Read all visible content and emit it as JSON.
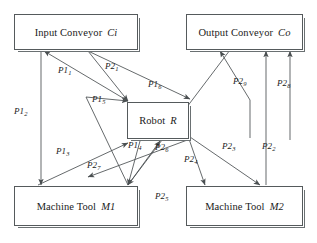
{
  "diagram": {
    "background_color": "#ffffff",
    "line_color": "#4a4f51",
    "box_border_color": "#555a5c",
    "box_shadow_color": "#6a7072",
    "text_color": "#1a1a1a",
    "nodes": [
      {
        "id": "Ci",
        "name": "Input Conveyor",
        "symbol": "Ci",
        "x": 14,
        "y": 14,
        "w": 124,
        "h": 36
      },
      {
        "id": "Co",
        "name": "Output Conveyor",
        "symbol": "Co",
        "x": 186,
        "y": 14,
        "w": 117,
        "h": 36
      },
      {
        "id": "R",
        "name": "Robot",
        "symbol": "R",
        "x": 127,
        "y": 102,
        "w": 62,
        "h": 37
      },
      {
        "id": "M1",
        "name": "Machine Tool",
        "symbol": "M1",
        "x": 14,
        "y": 186,
        "w": 124,
        "h": 40
      },
      {
        "id": "M2",
        "name": "Machine Tool",
        "symbol": "M2",
        "x": 186,
        "y": 186,
        "w": 117,
        "h": 40
      }
    ],
    "edge_labels": [
      {
        "id": "P1_1",
        "base": "P1",
        "sub": "1",
        "x": 58,
        "y": 66
      },
      {
        "id": "P1_2",
        "base": "P1",
        "sub": "2",
        "x": 14,
        "y": 107
      },
      {
        "id": "P1_3",
        "base": "P1",
        "sub": "3",
        "x": 56,
        "y": 147
      },
      {
        "id": "P1_4",
        "base": "P1",
        "sub": "4",
        "x": 128,
        "y": 141
      },
      {
        "id": "P1_5",
        "base": "P1",
        "sub": "5",
        "x": 92,
        "y": 95
      },
      {
        "id": "P1_6",
        "base": "P1",
        "sub": "6",
        "x": 148,
        "y": 80
      },
      {
        "id": "P2_1",
        "base": "P2",
        "sub": "1",
        "x": 105,
        "y": 62
      },
      {
        "id": "P2_2",
        "base": "P2",
        "sub": "2",
        "x": 262,
        "y": 142
      },
      {
        "id": "P2_3",
        "base": "P2",
        "sub": "3",
        "x": 222,
        "y": 142
      },
      {
        "id": "P2_4",
        "base": "P2",
        "sub": "4",
        "x": 184,
        "y": 155
      },
      {
        "id": "P2_5",
        "base": "P2",
        "sub": "5",
        "x": 155,
        "y": 192
      },
      {
        "id": "P2_6",
        "base": "P2",
        "sub": "6",
        "x": 155,
        "y": 143
      },
      {
        "id": "P2_7",
        "base": "P2",
        "sub": "7",
        "x": 87,
        "y": 161
      },
      {
        "id": "P2_8",
        "base": "P2",
        "sub": "8",
        "x": 277,
        "y": 79
      },
      {
        "id": "P2_9",
        "base": "P2",
        "sub": "9",
        "x": 233,
        "y": 77
      }
    ],
    "edges": [
      {
        "id": "e-R-to-Ci-a",
        "from": "R",
        "to": "Ci",
        "label": "P1_1",
        "path": "M 128,101 L 44,51",
        "arrow_at": "end"
      },
      {
        "id": "e-Ci-to-M1",
        "from": "Ci",
        "to": "M1",
        "label": "P1_2",
        "path": "M 41,51 L 41,185",
        "arrow_at": "end"
      },
      {
        "id": "e-M1-to-R-a",
        "from": "M1",
        "to": "R",
        "label": "P1_3",
        "path": "M 38,185 L 128,143",
        "arrow_at": "end"
      },
      {
        "id": "e-R-to-M1-a",
        "from": "R",
        "to": "M1",
        "label": "P1_4",
        "path": "M 140,141 L 128,185",
        "arrow_at": "end"
      },
      {
        "id": "e-M1-to-Ci",
        "from": "M1",
        "to": "Ci",
        "label": "P1_5",
        "path": "M 128,185 L 86,97 L 128,101",
        "arrow_at": "end"
      },
      {
        "id": "e-Ci-to-R-b",
        "from": "Ci",
        "to": "R",
        "label": "P1_6",
        "path": "M 88,51 L 190,99",
        "arrow_at": "end"
      },
      {
        "id": "e-Ci-to-R-a",
        "from": "Ci",
        "to": "R",
        "label": "P2_1",
        "path": "M 88,51 L 128,101",
        "arrow_at": "end"
      },
      {
        "id": "e-M2-to-Co-b",
        "from": "M2",
        "to": "Co",
        "label": "P2_2",
        "path": "M 266,185 L 266,51",
        "arrow_at": "end"
      },
      {
        "id": "e-R-to-M2",
        "from": "R",
        "to": "M2",
        "label": "P2_3",
        "path": "M 190,137 L 260,185",
        "arrow_at": "end"
      },
      {
        "id": "e-R-to-M2-b",
        "from": "R",
        "to": "M2",
        "label": "P2_4",
        "path": "M 189,139 L 205,185",
        "arrow_at": "end"
      },
      {
        "id": "e-M2-to-M1",
        "from": "M2",
        "to": "M1",
        "label": "P2_5",
        "path": "M 230,50 L 128,185",
        "arrow_at": "end"
      },
      {
        "id": "e-M1-to-R-b",
        "from": "M1",
        "to": "R",
        "label": "P2_6",
        "path": "M 128,185 L 160,141",
        "arrow_at": "end"
      },
      {
        "id": "e-R-to-M1-b",
        "from": "M1",
        "to": "R",
        "label": "P2_7",
        "path": "M 190,139 L 88,177",
        "arrow_at": "end"
      },
      {
        "id": "e-M2-to-Co-a",
        "from": "M2",
        "to": "Co",
        "label": "P2_8",
        "path": "M 290,140 L 290,51",
        "arrow_at": "end"
      },
      {
        "id": "e-R-to-Co",
        "from": "R",
        "to": "Co",
        "label": "P2_9",
        "path": "M 250,138 L 250,100 L 220,51",
        "arrow_at": "end"
      }
    ]
  }
}
